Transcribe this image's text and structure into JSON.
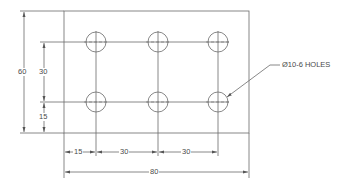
{
  "drawing": {
    "colors": {
      "line": "#6a6a6a",
      "text": "#4a4a4a",
      "background": "#ffffff"
    },
    "plate": {
      "width": 80,
      "height": 60
    },
    "holes": {
      "count": 6,
      "diameter": 10,
      "rows": 2,
      "cols": 3,
      "callout": "Ø10-6 HOLES"
    },
    "dimensions": {
      "overall_height": "60",
      "row_spacing": "30",
      "bottom_row_offset": "15",
      "first_col_offset": "15",
      "col_spacing_1": "30",
      "col_spacing_2": "30",
      "overall_width": "80"
    }
  }
}
